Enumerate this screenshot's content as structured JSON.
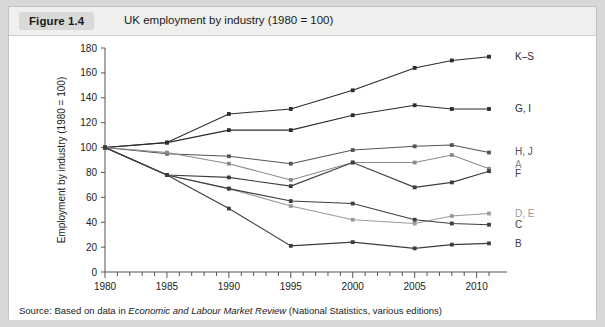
{
  "figure": {
    "badge": "Figure 1.4",
    "title": "UK employment by industry (1980 = 100)",
    "source_prefix": "Source: Based on data in ",
    "source_italic": "Economic and Labour Market Review",
    "source_suffix": " (National Statistics, various editions)"
  },
  "chart_data": {
    "type": "line",
    "title": "UK employment by industry (1980 = 100)",
    "xlabel": "",
    "ylabel": "Employment by industry (1980 = 100)",
    "x": [
      1980,
      1985,
      1990,
      1995,
      2000,
      2005,
      2008,
      2011
    ],
    "xlim": [
      1980,
      2011
    ],
    "ylim": [
      0,
      180
    ],
    "yticks": [
      0,
      20,
      40,
      60,
      80,
      100,
      120,
      140,
      160,
      180
    ],
    "xticks": [
      1980,
      1985,
      1990,
      1995,
      2000,
      2005,
      2010
    ],
    "xminor_step": 1,
    "grid": false,
    "legend_position": "right-of-axes-inline",
    "series": [
      {
        "name": "K–S",
        "label": "K–S",
        "color": "#2b2b2b",
        "values": [
          100,
          104,
          127,
          131,
          146,
          164,
          170,
          173
        ]
      },
      {
        "name": "G, I",
        "label": "G, I",
        "color": "#2b2b2b",
        "values": [
          100,
          104,
          114,
          114,
          126,
          134,
          131,
          131
        ]
      },
      {
        "name": "H, J",
        "label": "H, J",
        "color": "#555555",
        "values": [
          100,
          95,
          93,
          87,
          98,
          101,
          102,
          96
        ]
      },
      {
        "name": "A",
        "label": "A",
        "color": "#8a8a8a",
        "values": [
          100,
          96,
          87,
          74,
          88,
          88,
          94,
          83
        ]
      },
      {
        "name": "F",
        "label": "F",
        "color": "#3d3d3d",
        "values": [
          100,
          78,
          76,
          69,
          88,
          68,
          72,
          81
        ]
      },
      {
        "name": "D, E",
        "label": "D, E",
        "color": "#9a9a9a",
        "values": [
          100,
          78,
          67,
          53,
          42,
          39,
          45,
          47
        ]
      },
      {
        "name": "C",
        "label": "C",
        "color": "#3d3d3d",
        "values": [
          100,
          78,
          67,
          57,
          55,
          42,
          39,
          38
        ]
      },
      {
        "name": "B",
        "label": "B",
        "color": "#3d3d3d",
        "values": [
          100,
          78,
          51,
          21,
          24,
          19,
          22,
          23
        ]
      }
    ],
    "label_y_override": {
      "K–S": 173,
      "G, I": 131,
      "H, J": 97,
      "A": 86,
      "F": 79,
      "D, E": 47,
      "C": 38,
      "B": 23
    }
  }
}
